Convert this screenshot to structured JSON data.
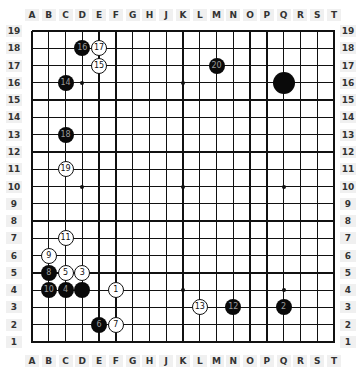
{
  "board": {
    "size": 19,
    "columns": [
      "A",
      "B",
      "C",
      "D",
      "E",
      "F",
      "G",
      "H",
      "J",
      "K",
      "L",
      "M",
      "N",
      "O",
      "P",
      "Q",
      "R",
      "S",
      "T"
    ],
    "rows": [
      "19",
      "18",
      "17",
      "16",
      "15",
      "14",
      "13",
      "12",
      "11",
      "10",
      "9",
      "8",
      "7",
      "6",
      "5",
      "4",
      "3",
      "2",
      "1"
    ],
    "star_points": [
      "D16",
      "K16",
      "Q16",
      "D10",
      "K10",
      "Q10",
      "D4",
      "K4",
      "Q4"
    ],
    "colors": {
      "line": "#111111",
      "black_stone": "#0a0a0a",
      "white_stone": "#ffffff",
      "background": "#ffffff"
    }
  },
  "stones": [
    {
      "pos": "F4",
      "color": "white",
      "label": "1"
    },
    {
      "pos": "Q3",
      "color": "black",
      "label": "2"
    },
    {
      "pos": "D5",
      "color": "white",
      "label": "3"
    },
    {
      "pos": "C4",
      "color": "black",
      "label": "4"
    },
    {
      "pos": "C5",
      "color": "white",
      "label": "5"
    },
    {
      "pos": "E2",
      "color": "black",
      "label": "6"
    },
    {
      "pos": "F2",
      "color": "white",
      "label": "7"
    },
    {
      "pos": "B5",
      "color": "black",
      "label": "8"
    },
    {
      "pos": "B6",
      "color": "white",
      "label": "9"
    },
    {
      "pos": "B4",
      "color": "black",
      "label": "10"
    },
    {
      "pos": "C7",
      "color": "white",
      "label": "11"
    },
    {
      "pos": "N3",
      "color": "black",
      "label": "12"
    },
    {
      "pos": "L3",
      "color": "white",
      "label": "13"
    },
    {
      "pos": "C16",
      "color": "black",
      "label": "14"
    },
    {
      "pos": "E17",
      "color": "white",
      "label": "15"
    },
    {
      "pos": "D18",
      "color": "black",
      "label": "16"
    },
    {
      "pos": "E18",
      "color": "white",
      "label": "17"
    },
    {
      "pos": "C13",
      "color": "black",
      "label": "18"
    },
    {
      "pos": "C11",
      "color": "white",
      "label": "19"
    },
    {
      "pos": "M17",
      "color": "black",
      "label": "20"
    },
    {
      "pos": "D4",
      "color": "black",
      "label": ""
    },
    {
      "pos": "Q16",
      "color": "black",
      "label": "",
      "large": true
    }
  ]
}
